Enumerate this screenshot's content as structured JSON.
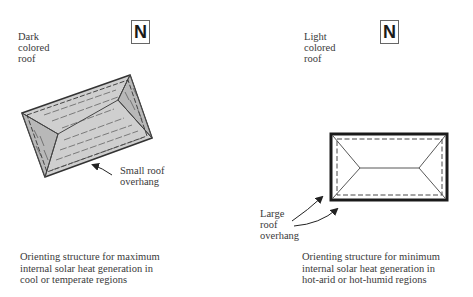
{
  "left_panel": {
    "roof_label": "Dark\ncolored\nroof",
    "north_label": "N",
    "overhang_label": "Small roof\noverhang",
    "caption": "Orienting structure for maximum\ninternal solar heat generation in\ncool or temperate regions",
    "roof_fill": "#cfcfcf",
    "hip_fill": "#bdbdbd"
  },
  "right_panel": {
    "roof_label": "Light\ncolored\nroof",
    "north_label": "N",
    "overhang_label": "Large\nroof\noverhang",
    "caption": "Orienting structure for minimum\ninternal solar heat generation in\nhot-arid or hot-humid regions",
    "roof_fill": "#ffffff"
  }
}
